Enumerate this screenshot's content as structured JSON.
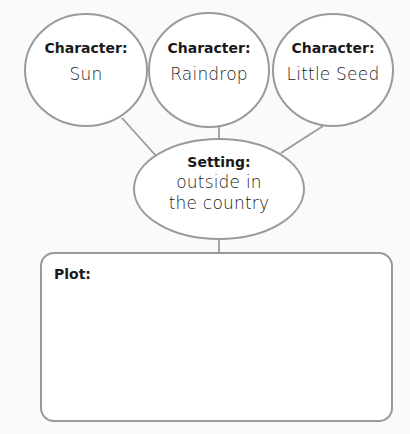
{
  "diagram": {
    "characters": [
      {
        "label": "Character:",
        "value": "Sun"
      },
      {
        "label": "Character:",
        "value": "Raindrop"
      },
      {
        "label": "Character:",
        "value": "Little Seed"
      }
    ],
    "setting": {
      "label": "Setting:",
      "value_line1": "outside in",
      "value_line2": "the country"
    },
    "plot": {
      "label": "Plot:",
      "value": ""
    }
  },
  "colors": {
    "stroke": "#9a9a9a",
    "fill": "#ffffff",
    "text": "#1a1a1a"
  }
}
